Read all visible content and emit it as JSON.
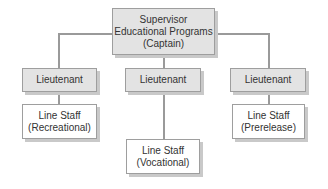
{
  "diagram": {
    "type": "org-chart",
    "root": {
      "lines": [
        "Supervisor",
        "Educational Programs",
        "(Captain)"
      ]
    },
    "branches": [
      {
        "lieutenant": "Lieutenant",
        "staff": [
          "Line Staff",
          "(Recreational)"
        ]
      },
      {
        "lieutenant": "Lieutenant",
        "staff": [
          "Line Staff",
          "(Vocational)"
        ]
      },
      {
        "lieutenant": "Lieutenant",
        "staff": [
          "Line Staff",
          "(Prerelease)"
        ]
      }
    ],
    "colors": {
      "header_fill": "#e3e3e3",
      "staff_fill": "#ffffff",
      "connector": "#9a9a9a"
    }
  }
}
